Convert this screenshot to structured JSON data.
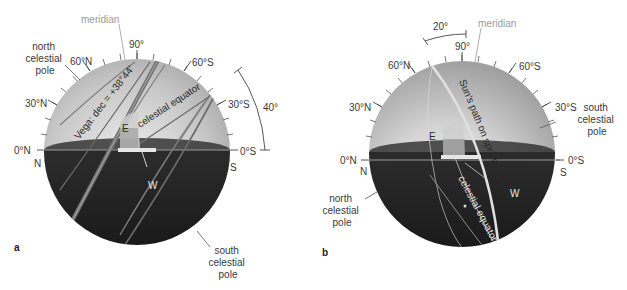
{
  "figure": {
    "panels": [
      {
        "id": "a",
        "panel_label": "a",
        "meridian_label": "meridian",
        "altitude_labels": {
          "zenith": "90°",
          "n60": "60°N",
          "s60": "60°S",
          "n30": "30°N",
          "s30": "30°S",
          "n0": "0°N",
          "s0": "0°S"
        },
        "horizon_points": {
          "north": "N",
          "south": "S",
          "east": "E",
          "west": "W"
        },
        "north_pole_label": [
          "north",
          "celestial",
          "pole"
        ],
        "south_pole_label": [
          "south",
          "celestial",
          "pole"
        ],
        "star_path_label": "Vega: dec = +38°44′",
        "equator_label": "celestial equator",
        "angle_arc_label": "40°"
      },
      {
        "id": "b",
        "panel_label": "b",
        "meridian_label": "meridian",
        "altitude_labels": {
          "zenith": "90°",
          "n60": "60°N",
          "s60": "60°S",
          "n30": "30°N",
          "s30": "30°S",
          "n0": "0°N",
          "s0": "0°S"
        },
        "horizon_points": {
          "north": "N",
          "south": "S",
          "east": "E",
          "west": "W"
        },
        "north_pole_label": [
          "north",
          "celestial",
          "pole"
        ],
        "south_pole_label": [
          "south",
          "celestial",
          "pole"
        ],
        "sun_path_label": "Sun's path on spring equinox",
        "equator_label": "celestial equator",
        "angle_arc_label": "20°"
      }
    ],
    "colors": {
      "sky_light": "#e4e4e4",
      "sky_dark": "#a8a8a8",
      "ground_light": "#5a5a5a",
      "ground_dark": "#1e1e1e",
      "path_line": "#7a7a7a",
      "label_text": "#3a3a3a",
      "meridian_text": "#9a9a9a"
    }
  }
}
